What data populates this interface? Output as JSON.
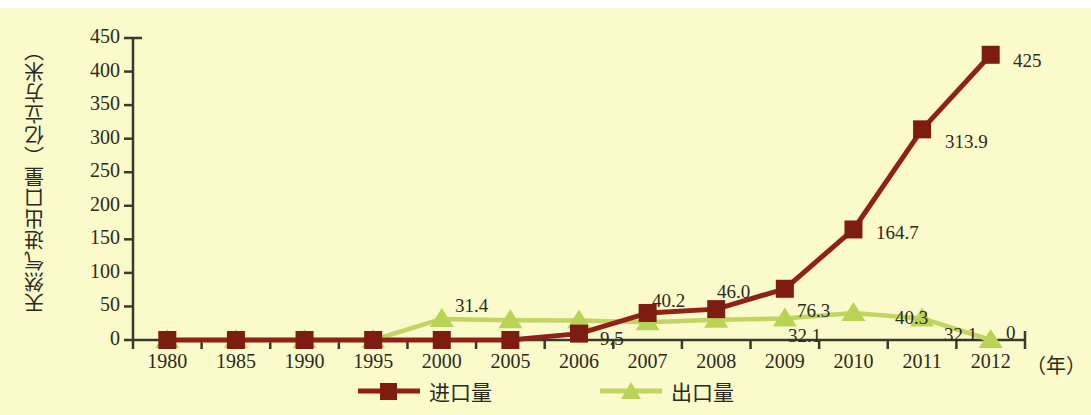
{
  "chart_data": {
    "type": "line",
    "title": "",
    "xlabel": "（年）",
    "ylabel": "天然气进出口量（亿立方米）",
    "categories": [
      "1980",
      "1985",
      "1990",
      "1995",
      "2000",
      "2005",
      "2006",
      "2007",
      "2008",
      "2009",
      "2010",
      "2011",
      "2012"
    ],
    "ylim": [
      0,
      450
    ],
    "yticks": [
      0,
      50,
      100,
      150,
      200,
      250,
      300,
      350,
      400,
      450
    ],
    "grid": false,
    "legend_position": "bottom",
    "series": [
      {
        "name": "进口量",
        "color": "#8f2116",
        "marker": "square",
        "values": [
          0,
          0,
          0,
          0,
          0,
          0,
          9.5,
          40.2,
          46.0,
          76.3,
          164.7,
          313.9,
          425
        ],
        "labels": [
          "",
          "",
          "",
          "",
          "",
          "",
          "9.5",
          "40.2",
          "46.0",
          "76.3",
          "164.7",
          "313.9",
          "425"
        ]
      },
      {
        "name": "出口量",
        "color": "#c2d461",
        "marker": "triangle",
        "values": [
          0,
          0,
          0,
          0,
          31.4,
          29.5,
          29.0,
          26.5,
          30.0,
          32.1,
          40.3,
          32.1,
          0
        ],
        "labels": [
          "",
          "",
          "",
          "",
          "31.4",
          "",
          "",
          "",
          "",
          "32.1",
          "40.3",
          "32.1",
          "0"
        ]
      }
    ]
  },
  "axis": {
    "y_tick_labels": [
      "450",
      "400",
      "350",
      "300",
      "250",
      "200",
      "150",
      "100",
      "50",
      "0"
    ],
    "x_tick_labels": [
      "1980",
      "1985",
      "1990",
      "1995",
      "2000",
      "2005",
      "2006",
      "2007",
      "2008",
      "2009",
      "2010",
      "2011",
      "2012"
    ],
    "x_unit": "（年）",
    "y_title": "天然气进出口量（亿立方米）"
  },
  "legend": {
    "items": [
      {
        "label": "进口量",
        "color": "#8f2116",
        "marker": "square"
      },
      {
        "label": "出口量",
        "color": "#c2d461",
        "marker": "triangle"
      }
    ]
  },
  "data_labels": {
    "import": [
      {
        "text": "9.5",
        "x": 600,
        "y": 328
      },
      {
        "text": "40.2",
        "x": 652,
        "y": 290
      },
      {
        "text": "46.0",
        "x": 717,
        "y": 281
      },
      {
        "text": "76.3",
        "x": 797,
        "y": 300
      },
      {
        "text": "164.7",
        "x": 876,
        "y": 222
      },
      {
        "text": "313.9",
        "x": 945,
        "y": 131
      },
      {
        "text": "425",
        "x": 1013,
        "y": 50
      }
    ],
    "export": [
      {
        "text": "31.4",
        "x": 455,
        "y": 295
      },
      {
        "text": "32.1",
        "x": 788,
        "y": 325
      },
      {
        "text": "40.3",
        "x": 895,
        "y": 307
      },
      {
        "text": "32.1",
        "x": 944,
        "y": 324
      },
      {
        "text": "0",
        "x": 1006,
        "y": 322
      }
    ]
  },
  "colors": {
    "background": "#fbfacb",
    "axis": "#3a3a2c",
    "text": "#2b2a20",
    "import_line": "#8f2116",
    "export_line": "#c2d461"
  }
}
